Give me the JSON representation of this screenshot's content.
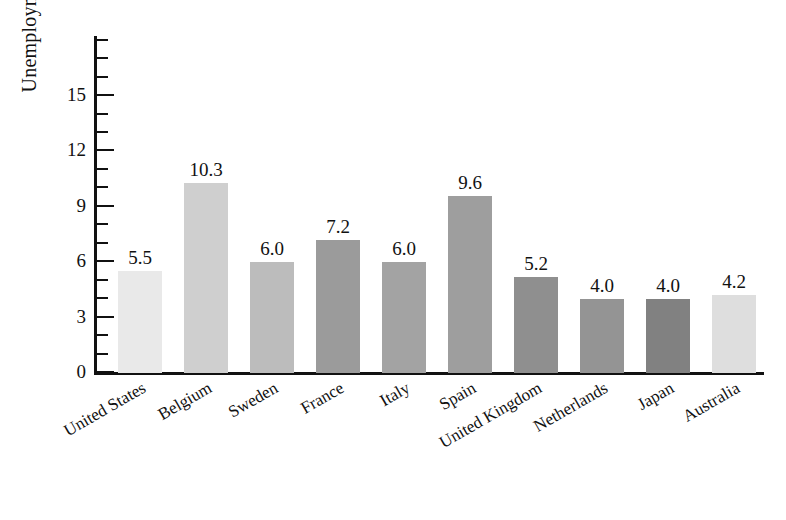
{
  "chart_data": {
    "type": "bar",
    "title": "",
    "xlabel": "",
    "ylabel": "Unemployment rate",
    "ylim": [
      0,
      18.2
    ],
    "grid": false,
    "legend": "none",
    "y_major_ticks": [
      0,
      3,
      6,
      9,
      12,
      15
    ],
    "y_minor_tick_step": 1,
    "y_tick_labels": [
      "0",
      "3",
      "6",
      "9",
      "12",
      "15"
    ],
    "categories": [
      "United States",
      "Belgium",
      "Sweden",
      "France",
      "Italy",
      "Spain",
      "United Kingdom",
      "Netherlands",
      "Japan",
      "Australia"
    ],
    "values": [
      5.5,
      10.3,
      6.0,
      7.2,
      6.0,
      9.6,
      5.2,
      4.0,
      4.0,
      4.2
    ],
    "value_labels": [
      "5.5",
      "10.3",
      "6.0",
      "7.2",
      "6.0",
      "9.6",
      "5.2",
      "4.0",
      "4.0",
      "4.2"
    ],
    "bar_colors": [
      "#e9e9e9",
      "#cfcfcf",
      "#bcbcbc",
      "#9b9b9b",
      "#a3a3a3",
      "#9e9e9e",
      "#8f8f8f",
      "#949494",
      "#818181",
      "#dedede"
    ],
    "axis_color": "#111111",
    "background_color": "#ffffff"
  }
}
